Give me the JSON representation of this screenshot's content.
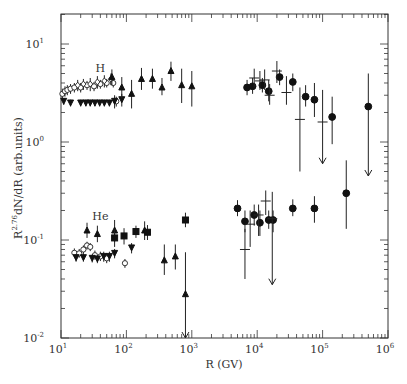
{
  "chart_data": {
    "type": "scatter",
    "title": "",
    "xlabel": "R (GV)",
    "ylabel": "R^2.76 dN/dR (arb.units)",
    "xscale": "log",
    "yscale": "log",
    "xlim": [
      10,
      1000000
    ],
    "ylim": [
      0.01,
      20
    ],
    "x_ticks": [
      {
        "v": 10,
        "base": "10",
        "exp": "1"
      },
      {
        "v": 100,
        "base": "10",
        "exp": "2"
      },
      {
        "v": 1000,
        "base": "10",
        "exp": "3"
      },
      {
        "v": 10000,
        "base": "10",
        "exp": "4"
      },
      {
        "v": 100000,
        "base": "10",
        "exp": "5"
      },
      {
        "v": 1000000,
        "base": "10",
        "exp": "6"
      }
    ],
    "y_ticks": [
      {
        "v": 0.01,
        "base": "10",
        "exp": "-2"
      },
      {
        "v": 0.1,
        "base": "10",
        "exp": "-1"
      },
      {
        "v": 1,
        "base": "10",
        "exp": "0"
      },
      {
        "v": 10,
        "base": "10",
        "exp": "1"
      }
    ],
    "annotations": [
      {
        "text": "H",
        "x": 40,
        "y": 5.2
      },
      {
        "text": "He",
        "x": 40,
        "y": 0.16
      }
    ],
    "series": [
      {
        "name": "H open circles",
        "marker": "open-circle",
        "points": [
          [
            10.5,
            3.1,
            2.7,
            3.5
          ],
          [
            11.5,
            3.3,
            2.9,
            3.7
          ],
          [
            12.5,
            3.4,
            3.0,
            3.8
          ],
          [
            14,
            3.5,
            3.1,
            3.9
          ],
          [
            16,
            3.6,
            3.2,
            4.0
          ],
          [
            20,
            3.6,
            3.2,
            4.0
          ],
          [
            25,
            3.8,
            3.4,
            4.2
          ],
          [
            32,
            3.7,
            3.3,
            4.1
          ],
          [
            40,
            3.9,
            3.5,
            4.3
          ],
          [
            50,
            4.0,
            3.6,
            4.4
          ],
          [
            63,
            4.0,
            3.6,
            4.4
          ],
          [
            70,
            2.6,
            2.3,
            2.9
          ]
        ]
      },
      {
        "name": "H diamonds",
        "marker": "diamond",
        "points": [
          [
            18,
            3.8,
            3.3,
            4.3
          ],
          [
            22,
            3.9,
            3.4,
            4.4
          ],
          [
            28,
            3.9,
            3.3,
            4.5
          ],
          [
            36,
            4.1,
            3.5,
            4.7
          ],
          [
            46,
            4.2,
            3.6,
            4.8
          ],
          [
            58,
            4.4,
            3.8,
            5.0
          ]
        ]
      },
      {
        "name": "H down triangles",
        "marker": "down-triangle",
        "points": [
          [
            11,
            2.6,
            2.4,
            2.8
          ],
          [
            14,
            2.5,
            2.3,
            2.7
          ],
          [
            20,
            2.5,
            2.3,
            2.7
          ],
          [
            24,
            2.5,
            2.3,
            2.7
          ],
          [
            28,
            2.5,
            2.3,
            2.7
          ],
          [
            33,
            2.5,
            2.3,
            2.7
          ],
          [
            39,
            2.5,
            2.3,
            2.7
          ],
          [
            46,
            2.5,
            2.3,
            2.7
          ],
          [
            55,
            2.5,
            2.3,
            2.7
          ],
          [
            66,
            2.6,
            2.2,
            3.0
          ],
          [
            85,
            2.7,
            2.3,
            3.1
          ]
        ]
      },
      {
        "name": "H up triangles",
        "marker": "up-triangle",
        "points": [
          [
            60,
            4.6,
            3.8,
            5.5
          ],
          [
            85,
            3.6,
            2.8,
            4.6
          ],
          [
            120,
            3.1,
            2.2,
            4.3
          ],
          [
            170,
            4.4,
            3.4,
            5.7
          ],
          [
            250,
            4.4,
            3.5,
            5.6
          ],
          [
            350,
            3.6,
            3.0,
            4.5
          ],
          [
            480,
            5.3,
            4.2,
            6.6
          ],
          [
            700,
            3.8,
            2.5,
            5.6
          ],
          [
            1000,
            3.7,
            2.3,
            5.3
          ]
        ]
      },
      {
        "name": "H filled circles",
        "marker": "filled-circle",
        "points": [
          [
            7000,
            3.6,
            3.0,
            4.3
          ],
          [
            8500,
            3.7,
            3.1,
            4.5
          ],
          [
            12000,
            3.8,
            3.2,
            4.5
          ],
          [
            15000,
            3.3,
            2.6,
            4.3
          ],
          [
            22000,
            4.6,
            3.8,
            5.5
          ],
          [
            35000,
            4.1,
            3.3,
            5.0
          ],
          [
            55000,
            2.9,
            2.3,
            3.8
          ],
          [
            75000,
            2.7,
            1.8,
            4.0
          ],
          [
            140000,
            1.8,
            0.95,
            2.9
          ],
          [
            500000,
            2.3,
            0.45,
            5.0
          ]
        ]
      },
      {
        "name": "H crosses",
        "marker": "cross",
        "points": [
          [
            9000,
            4.5,
            3.6,
            5.6
          ],
          [
            11000,
            4.2,
            3.4,
            5.3
          ],
          [
            13000,
            4.3,
            3.4,
            5.5
          ],
          [
            15500,
            3.0,
            2.4,
            3.9
          ],
          [
            20000,
            5.3,
            4.0,
            6.7
          ],
          [
            28000,
            3.2,
            2.4,
            4.7
          ],
          [
            45000,
            1.7,
            0.5,
            3.6
          ],
          [
            100000,
            1.6,
            0.6,
            3.4
          ]
        ]
      },
      {
        "name": "He open circles",
        "marker": "open-circle",
        "points": [
          [
            16,
            0.074,
            0.067,
            0.082
          ],
          [
            19,
            0.073,
            0.066,
            0.081
          ],
          [
            22,
            0.08,
            0.072,
            0.088
          ],
          [
            25,
            0.088,
            0.08,
            0.096
          ],
          [
            28,
            0.085,
            0.077,
            0.093
          ],
          [
            33,
            0.07,
            0.063,
            0.078
          ],
          [
            40,
            0.068,
            0.061,
            0.076
          ],
          [
            50,
            0.065,
            0.058,
            0.073
          ],
          [
            95,
            0.058,
            0.052,
            0.064
          ]
        ]
      },
      {
        "name": "He down triangles",
        "marker": "down-triangle",
        "points": [
          [
            17,
            0.066,
            0.06,
            0.072
          ],
          [
            22,
            0.066,
            0.06,
            0.072
          ],
          [
            30,
            0.065,
            0.059,
            0.071
          ],
          [
            36,
            0.064,
            0.058,
            0.07
          ],
          [
            45,
            0.068,
            0.06,
            0.076
          ],
          [
            55,
            0.068,
            0.06,
            0.076
          ],
          [
            66,
            0.073,
            0.065,
            0.081
          ],
          [
            120,
            0.083,
            0.073,
            0.093
          ]
        ]
      },
      {
        "name": "He up triangles",
        "marker": "up-triangle",
        "points": [
          [
            25,
            0.125,
            0.105,
            0.15
          ],
          [
            36,
            0.115,
            0.095,
            0.14
          ],
          [
            66,
            0.125,
            0.095,
            0.16
          ],
          [
            190,
            0.125,
            0.1,
            0.155
          ],
          [
            380,
            0.062,
            0.044,
            0.09
          ],
          [
            560,
            0.068,
            0.05,
            0.09
          ],
          [
            800,
            0.028,
            0.01,
            0.075
          ]
        ]
      },
      {
        "name": "He squares",
        "marker": "square",
        "points": [
          [
            66,
            0.105,
            0.085,
            0.128
          ],
          [
            92,
            0.11,
            0.09,
            0.132
          ],
          [
            140,
            0.122,
            0.105,
            0.14
          ],
          [
            210,
            0.12,
            0.1,
            0.142
          ],
          [
            800,
            0.16,
            0.135,
            0.19
          ]
        ]
      },
      {
        "name": "He filled circles",
        "marker": "filled-circle",
        "points": [
          [
            5000,
            0.21,
            0.175,
            0.255
          ],
          [
            6500,
            0.155,
            0.12,
            0.2
          ],
          [
            9000,
            0.18,
            0.14,
            0.23
          ],
          [
            11000,
            0.15,
            0.11,
            0.2
          ],
          [
            15000,
            0.16,
            0.13,
            0.2
          ],
          [
            17500,
            0.16,
            0.12,
            0.2
          ],
          [
            35000,
            0.21,
            0.175,
            0.26
          ],
          [
            75000,
            0.21,
            0.15,
            0.28
          ],
          [
            230000,
            0.3,
            0.13,
            0.65
          ]
        ]
      },
      {
        "name": "He crosses",
        "marker": "cross",
        "points": [
          [
            6500,
            0.08,
            0.04,
            0.13
          ],
          [
            7800,
            0.145,
            0.085,
            0.2
          ],
          [
            10500,
            0.18,
            0.11,
            0.23
          ],
          [
            13500,
            0.25,
            0.18,
            0.32
          ],
          [
            17000,
            0.165,
            0.035,
            0.31
          ]
        ]
      }
    ],
    "upper_limit_arrows": [
      {
        "series": "H",
        "x": 100000,
        "y_from": 1.6,
        "y_to": 0.6
      },
      {
        "series": "H",
        "x": 500000,
        "y_from": 2.3,
        "y_to": 0.45
      },
      {
        "series": "He",
        "x": 17000,
        "y_from": 0.165,
        "y_to": 0.035
      },
      {
        "series": "He",
        "x": 800,
        "y_from": 0.028,
        "y_to": 0.01
      }
    ],
    "grid": false,
    "legend": "none"
  }
}
